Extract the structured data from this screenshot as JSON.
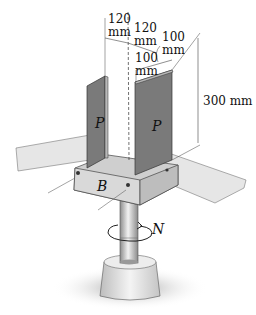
{
  "figure": {
    "labels": {
      "plate_left": "P",
      "plate_right": "P",
      "block": "B",
      "rotation": "N"
    },
    "dimensions": {
      "left_plate_offset_value": "120",
      "left_plate_offset_unit": "mm",
      "right_plate_offset_value": "120",
      "right_plate_offset_unit": "mm",
      "inner_width_value": "100",
      "inner_width_unit": "mm",
      "right_plate_width_value": "100",
      "right_plate_width_unit": "mm",
      "plate_height": "300 mm"
    },
    "colors": {
      "plate": "#7a7a7a",
      "plate_edge": "#b8b8b8",
      "base": "#d6d6d6",
      "bar": "#e2e2e2",
      "shaft": "#bdbdbd",
      "pedestal": "#e4e4e4",
      "shadow": "#9a9a9a"
    }
  }
}
